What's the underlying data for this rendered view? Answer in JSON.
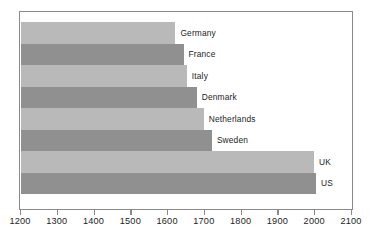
{
  "chart_data": {
    "type": "bar",
    "orientation": "horizontal",
    "title": "",
    "subtitle": "",
    "xlabel": "",
    "ylabel": "",
    "xlim": [
      1200,
      2100
    ],
    "xticks": [
      1200,
      1300,
      1400,
      1500,
      1600,
      1700,
      1800,
      1900,
      2000,
      2100
    ],
    "xtick_labels": [
      "1200",
      "1300",
      "1400",
      "1500",
      "1600",
      "1700",
      "1800",
      "1900",
      "2000",
      "2100"
    ],
    "grid": false,
    "legend": "none",
    "categories": [
      "Germany",
      "France",
      "Italy",
      "Denmark",
      "Netherlands",
      "Sweden",
      "UK",
      "US"
    ],
    "values": [
      1620,
      1642,
      1651,
      1678,
      1697,
      1719,
      1997,
      2002
    ],
    "bars": [
      {
        "label": "Germany",
        "value": 1620,
        "shade": "light"
      },
      {
        "label": "France",
        "value": 1642,
        "shade": "dark"
      },
      {
        "label": "Italy",
        "value": 1651,
        "shade": "light"
      },
      {
        "label": "Denmark",
        "value": 1678,
        "shade": "dark"
      },
      {
        "label": "Netherlands",
        "value": 1697,
        "shade": "light"
      },
      {
        "label": "Sweden",
        "value": 1719,
        "shade": "dark"
      },
      {
        "label": "UK",
        "value": 1997,
        "shade": "light"
      },
      {
        "label": "US",
        "value": 2002,
        "shade": "dark"
      }
    ],
    "colors": {
      "bar_light": "#b9b9b9",
      "bar_dark": "#909090",
      "frame": "#8a8a8a",
      "text": "#1d1d1d",
      "background": "#ffffff"
    }
  }
}
